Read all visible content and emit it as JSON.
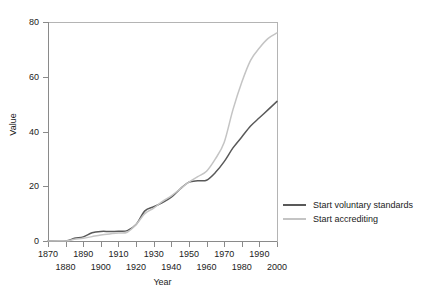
{
  "chart_data": {
    "type": "line",
    "title": "",
    "xlabel": "Year",
    "ylabel": "Value",
    "xlim": [
      1870,
      2000
    ],
    "ylim": [
      0,
      80
    ],
    "xticks": [
      1870,
      1880,
      1890,
      1900,
      1910,
      1920,
      1930,
      1940,
      1950,
      1960,
      1970,
      1980,
      1990,
      2000
    ],
    "yticks": [
      0,
      20,
      40,
      60,
      80
    ],
    "grid": false,
    "legend_position": "right",
    "x": [
      1870,
      1880,
      1885,
      1890,
      1895,
      1900,
      1905,
      1910,
      1915,
      1920,
      1925,
      1930,
      1935,
      1940,
      1945,
      1950,
      1955,
      1960,
      1965,
      1970,
      1975,
      1980,
      1985,
      1990,
      1995,
      2000
    ],
    "series": [
      {
        "name": "Start voluntary standards",
        "color": "#595959",
        "values": [
          0,
          0,
          1,
          1.5,
          3,
          3.5,
          3.5,
          3.6,
          3.8,
          6,
          11,
          12.5,
          14,
          16,
          19,
          21.5,
          22,
          22.2,
          25,
          29,
          34,
          38,
          42,
          45,
          48,
          51
        ]
      },
      {
        "name": "Start accrediting",
        "color": "#c4c4c4",
        "values": [
          0,
          0,
          0.6,
          1,
          1.6,
          2.2,
          2.6,
          2.9,
          3.2,
          6,
          10,
          12,
          14.5,
          16.5,
          19,
          21.5,
          23.5,
          25.5,
          30,
          36,
          48,
          58,
          66,
          70.5,
          74,
          76
        ]
      }
    ],
    "legend": [
      {
        "label": "Start voluntary standards",
        "color": "#595959"
      },
      {
        "label": "Start accrediting",
        "color": "#c4c4c4"
      }
    ],
    "axis_colors": {
      "spine": "#8a8a8a",
      "frame_light": "#b4b4b4",
      "text": "#222222",
      "background": "#ffffff"
    }
  }
}
